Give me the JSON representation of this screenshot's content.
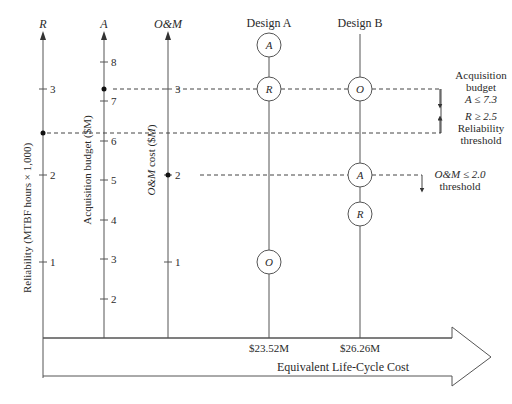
{
  "axes": {
    "R": {
      "label": "R",
      "title": "Reliability (MTBF hours × 1,000)",
      "ticks": [
        "1",
        "2",
        "3"
      ]
    },
    "A": {
      "label": "A",
      "title": "Acquisition budget ($M)",
      "ticks": [
        "2",
        "3",
        "4",
        "5",
        "6",
        "7",
        "8"
      ]
    },
    "OM": {
      "label": "O&M",
      "title": "O&M cost ($M)",
      "ticks": [
        "1",
        "2",
        "3"
      ]
    }
  },
  "designs": {
    "a": {
      "label": "Design A",
      "cost": "$23.52M",
      "markers": [
        "A",
        "R",
        "O"
      ]
    },
    "b": {
      "label": "Design B",
      "cost": "$26.26M",
      "markers": [
        "O",
        "A",
        "R"
      ]
    }
  },
  "annotations": {
    "acq_line1": "Acquisition",
    "acq_line2": "budget",
    "acq_line3": "A ≤ 7.3",
    "rel_line1": "R ≥ 2.5",
    "rel_line2": "Reliability",
    "rel_line3": "threshold",
    "om_line1": "O&M ≤ 2.0",
    "om_line2": "threshold"
  },
  "x_axis": {
    "label": "Equivalent  Life-Cycle Cost"
  },
  "colors": {
    "line": "#555555",
    "text": "#2a2a2a"
  }
}
